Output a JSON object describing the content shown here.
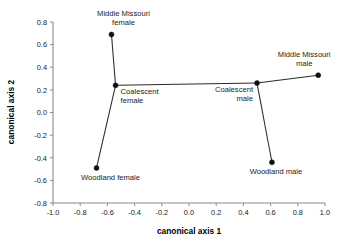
{
  "chart_data": {
    "type": "scatter",
    "title": "",
    "xlabel": "canonical axis 1",
    "ylabel": "canonical axis 2",
    "xlim": [
      -1.0,
      1.0
    ],
    "ylim": [
      -0.8,
      0.8
    ],
    "xticks": [
      "-1.0",
      "-0.8",
      "-0.6",
      "-0.4",
      "-0.2",
      "0.0",
      "0.2",
      "0.4",
      "0.6",
      "0.8",
      "1.0"
    ],
    "yticks": [
      "0.8",
      "0.6",
      "0.4",
      "0.2",
      "0.0",
      "-0.2",
      "-0.4",
      "-0.6",
      "-0.8"
    ],
    "xtick_values": [
      -1.0,
      -0.8,
      -0.6,
      -0.4,
      -0.2,
      0.0,
      0.2,
      0.4,
      0.6,
      0.8,
      1.0
    ],
    "ytick_values": [
      0.8,
      0.6,
      0.4,
      0.2,
      0.0,
      -0.2,
      -0.4,
      -0.6,
      -0.8
    ],
    "grid": false,
    "legend": "none",
    "points": [
      {
        "id": "middle-missouri-female",
        "label_line1": "Middle Missouri",
        "label_line2": "female",
        "x": -0.57,
        "y": 0.69,
        "label_anchor": "middle",
        "label_dx": 12,
        "label_dy": -18
      },
      {
        "id": "coalescent-female",
        "label_line1": "Coalescent",
        "label_line2": "female",
        "x": -0.54,
        "y": 0.24,
        "label_anchor": "start",
        "label_dx": 5,
        "label_dy": 9
      },
      {
        "id": "woodland-female",
        "label_line1": "Woodland female",
        "label_line2": "",
        "x": -0.68,
        "y": -0.49,
        "label_anchor": "middle",
        "label_dx": 14,
        "label_dy": 12
      },
      {
        "id": "coalescent-male",
        "label_line1": "Coalescent",
        "label_line2": "male",
        "x": 0.5,
        "y": 0.26,
        "label_anchor": "end",
        "label_dx": -4,
        "label_dy": 9
      },
      {
        "id": "middle-missouri-male",
        "label_line1": "Middle Missouri",
        "label_line2": "male",
        "x": 0.95,
        "y": 0.33,
        "label_anchor": "middle",
        "label_dx": -14,
        "label_dy": -18
      },
      {
        "id": "woodland-male",
        "label_line1": "Woodland male",
        "label_line2": "",
        "x": 0.61,
        "y": -0.44,
        "label_anchor": "middle",
        "label_dx": 4,
        "label_dy": 12
      }
    ],
    "links": [
      {
        "from": "woodland-female",
        "to": "coalescent-female"
      },
      {
        "from": "coalescent-female",
        "to": "middle-missouri-female"
      },
      {
        "from": "coalescent-female",
        "to": "coalescent-male"
      },
      {
        "from": "coalescent-male",
        "to": "middle-missouri-male"
      },
      {
        "from": "coalescent-male",
        "to": "woodland-male"
      }
    ],
    "colors": {
      "point": "#111111",
      "line": "#2b2b2b",
      "axis": "#8a8a8a",
      "text": "#1a1a1a",
      "background": "#ffffff"
    }
  }
}
